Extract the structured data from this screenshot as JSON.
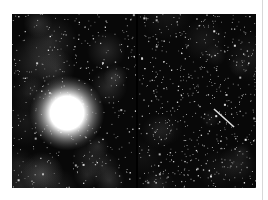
{
  "figure": {
    "colors": {
      "background": "#ffffff",
      "sky": "#080808",
      "nebula": "#6a6a6a",
      "star": "#ffffff",
      "edge_line": "#d8d8d8"
    },
    "panels": [
      {
        "id": "left",
        "content": "Nebula with dense star field and a large saturated bright star",
        "bright_star": {
          "x": 55,
          "y": 99,
          "radius": 17
        },
        "nebula_density": 0.55,
        "star_count": 420,
        "seed": 7
      },
      {
        "id": "right",
        "content": "Same region, fainter nebula, dense star field with a diagonal streak",
        "streak": {
          "x1": 76,
          "y1": 95,
          "x2": 96,
          "y2": 113
        },
        "nebula_density": 0.35,
        "star_count": 650,
        "seed": 19
      }
    ]
  }
}
